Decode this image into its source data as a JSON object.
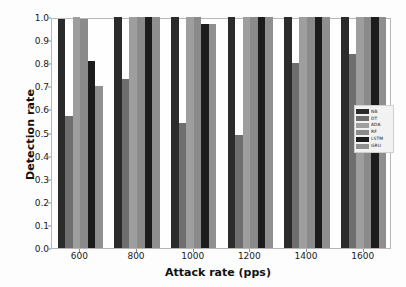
{
  "chart_data": {
    "type": "bar",
    "title": "",
    "xlabel": "Attack rate (pps)",
    "ylabel": "Detection rate",
    "categories": [
      "600",
      "800",
      "1000",
      "1200",
      "1400",
      "1600"
    ],
    "xtick_labels": [
      "600",
      "800",
      "1000",
      "1200",
      "1400",
      "1600"
    ],
    "ytick_labels": [
      "0.0",
      "0.1",
      "0.2",
      "0.3",
      "0.4",
      "0.5",
      "0.6",
      "0.7",
      "0.8",
      "0.9",
      "1.0"
    ],
    "ytick_values": [
      0.0,
      0.1,
      0.2,
      0.3,
      0.4,
      0.5,
      0.6,
      0.7,
      0.8,
      0.9,
      1.0
    ],
    "ylim": [
      0.0,
      1.0
    ],
    "grid": false,
    "legend_position": "center right",
    "series": [
      {
        "name": "NB",
        "color": "#2b2b2b",
        "values": [
          0.99,
          1.0,
          1.0,
          1.0,
          1.0,
          1.0
        ]
      },
      {
        "name": "DT",
        "color": "#6e6e6e",
        "values": [
          0.57,
          0.73,
          0.54,
          0.49,
          0.8,
          0.84
        ]
      },
      {
        "name": "ADA",
        "color": "#9e9e9e",
        "values": [
          1.0,
          1.0,
          1.0,
          1.0,
          1.0,
          1.0
        ]
      },
      {
        "name": "RF",
        "color": "#8a8a8a",
        "values": [
          0.99,
          1.0,
          1.0,
          1.0,
          1.0,
          1.0
        ]
      },
      {
        "name": "LSTM",
        "color": "#1c1c1c",
        "values": [
          0.81,
          1.0,
          0.97,
          1.0,
          1.0,
          1.0
        ]
      },
      {
        "name": "GRU",
        "color": "#8f8f8f",
        "values": [
          0.7,
          1.0,
          0.97,
          1.0,
          1.0,
          1.0
        ]
      }
    ]
  },
  "legend": {
    "entries": [
      {
        "label": "NB",
        "color": "#2b2b2b"
      },
      {
        "label": "DT",
        "color": "#6e6e6e"
      },
      {
        "label": "ADA",
        "color": "#9e9e9e"
      },
      {
        "label": "RF",
        "color": "#8a8a8a"
      },
      {
        "label": "LSTM",
        "color": "#1c1c1c"
      },
      {
        "label": "GRU",
        "color": "#8f8f8f"
      }
    ]
  }
}
